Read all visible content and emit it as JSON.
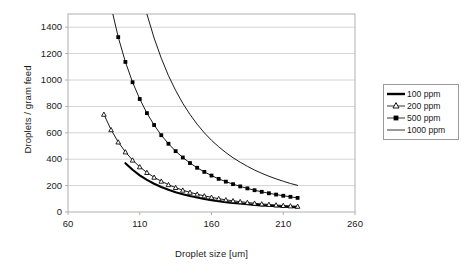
{
  "chart_data": {
    "type": "line",
    "title": "",
    "xlabel": "Droplet size [um]",
    "ylabel": "Droplets / gram feed",
    "xlim": [
      60,
      260
    ],
    "ylim": [
      0,
      1500
    ],
    "xticks": [
      60,
      110,
      160,
      210,
      260
    ],
    "yticks": [
      0,
      200,
      400,
      600,
      800,
      1000,
      1200,
      1400
    ],
    "grid": "horizontal",
    "legend_position": "right-outside",
    "series": [
      {
        "name": "100 ppm",
        "marker": "none",
        "line": "thick",
        "color": "#000000",
        "x": [
          100,
          105,
          110,
          115,
          120,
          125,
          130,
          135,
          140,
          145,
          150,
          155,
          160,
          165,
          170,
          175,
          180,
          185,
          190,
          195,
          200,
          205,
          210,
          215,
          220
        ],
        "y": [
          370,
          320,
          278,
          243,
          214,
          189,
          168,
          150,
          135,
          121,
          110,
          99,
          90,
          82,
          75,
          69,
          64,
          59,
          54,
          50,
          47,
          43,
          40,
          38,
          35
        ]
      },
      {
        "name": "200 ppm",
        "marker": "triangle-open",
        "line": "thin",
        "color": "#000000",
        "x": [
          85,
          90,
          95,
          100,
          105,
          110,
          115,
          120,
          125,
          130,
          135,
          140,
          145,
          150,
          155,
          160,
          165,
          170,
          175,
          180,
          185,
          190,
          195,
          200,
          205,
          210,
          215,
          220
        ],
        "y": [
          740,
          623,
          530,
          455,
          393,
          342,
          299,
          263,
          233,
          207,
          185,
          165,
          149,
          135,
          122,
          111,
          101,
          92,
          85,
          78,
          72,
          66,
          61,
          57,
          53,
          49,
          46,
          43
        ]
      },
      {
        "name": "500 ppm",
        "marker": "square-filled",
        "line": "thin",
        "color": "#000000",
        "x": [
          85,
          90,
          95,
          100,
          105,
          110,
          115,
          120,
          125,
          130,
          135,
          140,
          145,
          150,
          155,
          160,
          165,
          170,
          175,
          180,
          185,
          190,
          195,
          200,
          205,
          210,
          215,
          220
        ],
        "y": [
          1850,
          1558,
          1325,
          1137,
          983,
          856,
          749,
          659,
          582,
          517,
          461,
          413,
          371,
          335,
          304,
          276,
          251,
          230,
          211,
          194,
          179,
          165,
          153,
          142,
          132,
          123,
          115,
          107
        ]
      },
      {
        "name": "1000 ppm",
        "marker": "none",
        "line": "thin",
        "color": "#000000",
        "x": [
          105,
          110,
          115,
          120,
          125,
          130,
          135,
          140,
          145,
          150,
          155,
          160,
          165,
          170,
          175,
          180,
          185,
          190,
          195,
          200,
          205,
          210,
          215,
          220
        ],
        "y": [
          1966,
          1712,
          1499,
          1318,
          1165,
          1033,
          921,
          823,
          739,
          665,
          600,
          543,
          494,
          450,
          411,
          377,
          346,
          318,
          293,
          271,
          251,
          233,
          216,
          202
        ]
      }
    ]
  },
  "legend": {
    "items": [
      {
        "label": "100 ppm"
      },
      {
        "label": "200 ppm"
      },
      {
        "label": "500 ppm"
      },
      {
        "label": "1000 ppm"
      }
    ]
  },
  "axis": {
    "x_title": "Droplet size [um]",
    "y_title": "Droplets / gram feed",
    "xticklabels": [
      "60",
      "110",
      "160",
      "210",
      "260"
    ],
    "yticklabels": [
      "0",
      "200",
      "400",
      "600",
      "800",
      "1000",
      "1200",
      "1400"
    ]
  },
  "colors": {
    "line": "#000000",
    "grid": "#d4d4d4",
    "frame": "#b0b0b0",
    "text": "#1a1a1a"
  }
}
